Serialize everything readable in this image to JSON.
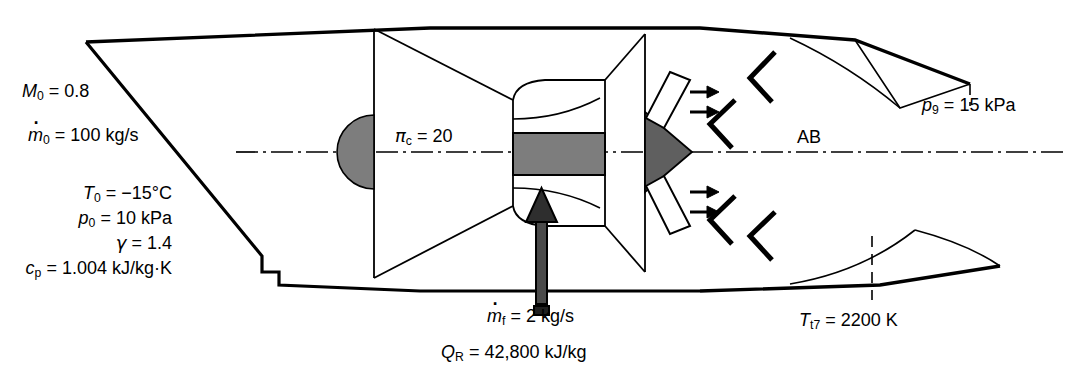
{
  "figure": {
    "kind": "turbojet-with-afterburner-schematic",
    "background_color": "#ffffff",
    "line_color": "#000000",
    "shade_color": "#7d7d7d"
  },
  "inlet_conditions": {
    "mach": {
      "symbol": "M",
      "subscript": "0",
      "value": "0.8",
      "text": "M0 = 0.8"
    },
    "mass_flow": {
      "symbol": "m",
      "subscript": "0",
      "value": "100 kg/s",
      "text": "m0 = 100 kg/s"
    },
    "temperature": {
      "symbol": "T",
      "subscript": "0",
      "value": "−15°C",
      "text": "T0 = −15°C"
    },
    "pressure": {
      "symbol": "p",
      "subscript": "0",
      "value": "10 kPa",
      "text": "p0 = 10 kPa"
    },
    "gamma": {
      "symbol": "γ",
      "value": "1.4",
      "text": "γ = 1.4"
    },
    "cp": {
      "symbol": "c",
      "subscript": "p",
      "value": "1.004 kJ/kg·K",
      "text": "cp = 1.004 kJ/kg·K"
    }
  },
  "compressor": {
    "pressure_ratio": {
      "symbol": "π",
      "subscript": "c",
      "value": "20",
      "text": "πc = 20"
    }
  },
  "burner": {
    "fuel_flow": {
      "symbol": "m",
      "subscript": "f",
      "value": "2 kg/s",
      "text": "mf = 2 kg/s"
    },
    "heating_value": {
      "symbol": "Q",
      "subscript": "R",
      "value": "42,800 kJ/kg",
      "text": "QR = 42,800 kJ/kg"
    }
  },
  "afterburner": {
    "label": "AB",
    "exit_temperature": {
      "symbol": "T",
      "subscript": "t7",
      "value": "2200 K",
      "text": "Tt7 = 2200 K"
    }
  },
  "nozzle": {
    "exit_pressure": {
      "symbol": "p",
      "subscript": "9",
      "value": "15 kPa",
      "text": "p9 = 15 kPa"
    }
  },
  "symbols": {
    "eq": "=",
    "M": "M",
    "mdot": "m",
    "T": "T",
    "p": "p",
    "gamma": "γ",
    "c": "c",
    "pi": "π",
    "Q": "Q",
    "sub_0": "0",
    "sub_p": "p",
    "sub_c": "c",
    "sub_f": "f",
    "sub_R": "R",
    "sub_9": "9",
    "sub_t7": "t7",
    "val_mach": "0.8",
    "val_mdot0": "100 kg/s",
    "val_T0": "−15°C",
    "val_p0": "10 kPa",
    "val_gamma": "1.4",
    "val_cp": "1.004 kJ/kg·K",
    "val_pic": "20",
    "val_mdotf": "2 kg/s",
    "val_QR": "42,800 kJ/kg",
    "val_Tt7": "2200 K",
    "val_p9": "15 kPa"
  }
}
